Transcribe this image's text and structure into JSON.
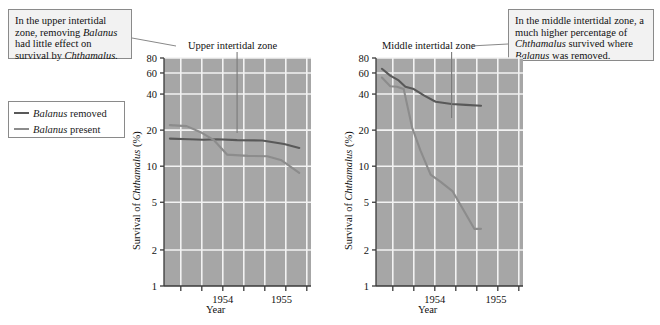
{
  "figure": {
    "callout_left": {
      "lines": [
        "In the upper intertidal",
        "zone, removing Balanus",
        "had little effect on",
        "survival by Chthamalus."
      ],
      "text": "In the upper intertidal zone, removing Balanus had little effect on survival by Chthamalus."
    },
    "callout_right": {
      "lines": [
        "In the middle intertidal zone,",
        "a much higher percentage of",
        "Chthamalus survived where",
        "Balanus was removed."
      ],
      "text": "In the middle intertidal zone, a much higher percentage of Chthamalus survived where Balanus was removed."
    },
    "legend": {
      "items": [
        {
          "label": "Balanus removed",
          "color": "#595959",
          "width": 2.2
        },
        {
          "label": "Balanus present",
          "color": "#8c8c8c",
          "width": 2.2
        }
      ]
    },
    "colors": {
      "plot_background": "#a6a6a6",
      "gridline": "#f2f2f2",
      "axis": "#3a3a3a",
      "removed_line": "#595959",
      "present_line": "#8c8c8c",
      "callout_background": "#f2f2f2",
      "callout_border": "#8a8a8a"
    }
  },
  "chart_data": [
    {
      "type": "line",
      "title": "Upper intertidal zone",
      "xlabel": "Year",
      "ylabel": "Survival of Chthamalus (%)",
      "yscale": "log",
      "ylim": [
        1,
        80
      ],
      "yticks": [
        1,
        2,
        5,
        10,
        20,
        40,
        60,
        80
      ],
      "ytick_labels": [
        "1",
        "2",
        "5",
        "10",
        "20",
        "40",
        "60",
        "80"
      ],
      "xlim": [
        1953.55,
        1955.3
      ],
      "xticks": [
        1953.75,
        1954.0,
        1954.25,
        1954.5,
        1954.75,
        1955.0,
        1955.25
      ],
      "xtick_labels": [
        "",
        "",
        "1954",
        "",
        "",
        "1955",
        ""
      ],
      "labeled_xticks": [
        {
          "value": 1954.25,
          "label": "1954"
        },
        {
          "value": 1954.95,
          "label": "1955"
        }
      ],
      "grid": true,
      "series": [
        {
          "name": "Balanus removed",
          "color": "#595959",
          "x": [
            1953.62,
            1953.85,
            1954.02,
            1954.18,
            1954.42,
            1954.72,
            1954.98,
            1955.16
          ],
          "y": [
            17.0,
            16.8,
            16.6,
            16.8,
            16.5,
            16.4,
            15.3,
            14.2
          ]
        },
        {
          "name": "Balanus present",
          "color": "#8c8c8c",
          "x": [
            1953.62,
            1953.82,
            1954.0,
            1954.14,
            1954.3,
            1954.55,
            1954.78,
            1954.95,
            1955.16
          ],
          "y": [
            22.0,
            21.6,
            19.0,
            16.6,
            12.5,
            12.2,
            12.1,
            11.2,
            8.8
          ]
        }
      ]
    },
    {
      "type": "line",
      "title": "Middle intertidal zone",
      "xlabel": "Year",
      "ylabel": "Survival of Chthamalus (%)",
      "yscale": "log",
      "ylim": [
        1,
        80
      ],
      "yticks": [
        1,
        2,
        5,
        10,
        20,
        40,
        60,
        80
      ],
      "ytick_labels": [
        "1",
        "2",
        "5",
        "10",
        "20",
        "40",
        "60",
        "80"
      ],
      "xlim": [
        1953.55,
        1955.3
      ],
      "xticks": [
        1953.75,
        1954.0,
        1954.25,
        1954.5,
        1954.75,
        1955.0,
        1955.25
      ],
      "xtick_labels": [
        "",
        "",
        "1954",
        "",
        "",
        "1955",
        ""
      ],
      "labeled_xticks": [
        {
          "value": 1954.25,
          "label": "1954"
        },
        {
          "value": 1954.98,
          "label": "1955"
        }
      ],
      "grid": true,
      "series": [
        {
          "name": "Balanus removed",
          "color": "#595959",
          "x": [
            1953.62,
            1953.72,
            1953.82,
            1953.9,
            1954.0,
            1954.12,
            1954.26,
            1954.45,
            1954.62,
            1954.8
          ],
          "y": [
            65.0,
            57.0,
            52.0,
            46.0,
            44.0,
            39.0,
            34.5,
            33.0,
            32.5,
            32.0
          ]
        },
        {
          "name": "Balanus present",
          "color": "#8c8c8c",
          "x": [
            1953.62,
            1953.72,
            1953.8,
            1953.88,
            1953.98,
            1954.08,
            1954.2,
            1954.32,
            1954.46,
            1954.6,
            1954.72,
            1954.8
          ],
          "y": [
            55.0,
            46.5,
            46.0,
            44.0,
            21.0,
            13.5,
            8.5,
            7.4,
            6.2,
            4.2,
            3.0,
            3.0
          ]
        }
      ]
    }
  ]
}
